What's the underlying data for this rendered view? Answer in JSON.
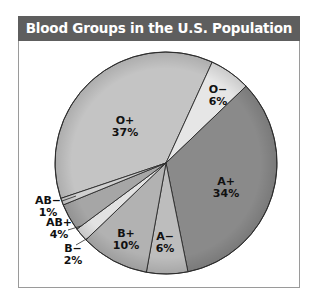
{
  "chart_data": {
    "type": "pie",
    "title": "Blood Groups in the U.S. Population",
    "categories": [
      "O+",
      "O−",
      "A+",
      "A−",
      "B+",
      "B−",
      "AB+",
      "AB−"
    ],
    "values": [
      37,
      6,
      34,
      6,
      10,
      2,
      4,
      1
    ],
    "unit": "%",
    "labels": [
      "O+ 37%",
      "O− 6%",
      "A+ 34%",
      "A− 6%",
      "B+ 10%",
      "B− 2%",
      "AB+ 4%",
      "AB− 1%"
    ],
    "colors": {
      "O+": "#c4c4c4",
      "O−": "#e6e6e6",
      "A+": "#8a8a8a",
      "A−": "#bdbdbd",
      "B+": "#b2b2b2",
      "B−": "#e2e2e2",
      "AB+": "#a6a6a6",
      "AB−": "#d0d0d0"
    },
    "legend": "none (labels on slices)"
  },
  "header": {
    "title": "Blood Groups in the U.S. Population"
  },
  "slices": [
    {
      "name": "O+",
      "pct": "37%"
    },
    {
      "name": "O−",
      "pct": "6%"
    },
    {
      "name": "A+",
      "pct": "34%"
    },
    {
      "name": "A−",
      "pct": "6%"
    },
    {
      "name": "B+",
      "pct": "10%"
    },
    {
      "name": "B−",
      "pct": "2%"
    },
    {
      "name": "AB+",
      "pct": "4%"
    },
    {
      "name": "AB−",
      "pct": "1%"
    }
  ]
}
